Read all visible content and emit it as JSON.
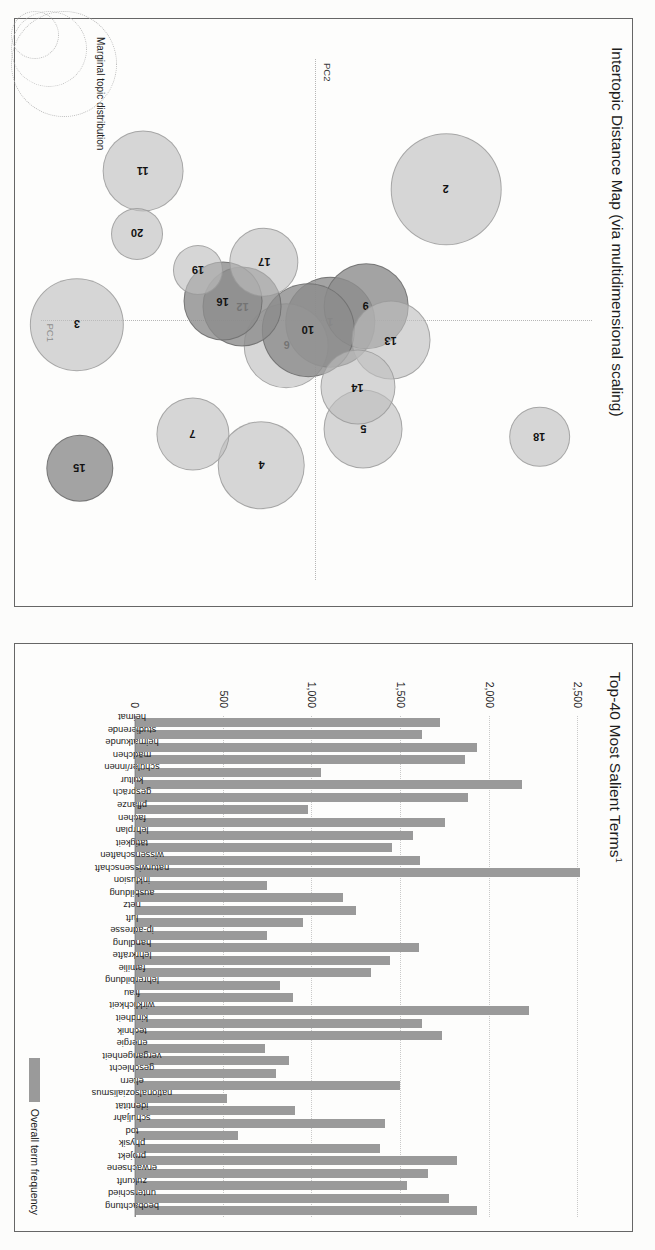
{
  "document": {
    "kind": "pyLDAvis topic model visualization (rotated scan)",
    "page_background": "#fcfcfb",
    "bar_color": "#9a9a9a",
    "bubble_color": "#bebebe"
  },
  "bar_panel": {
    "title": "Top-40 Most Salient Terms",
    "title_superscript": "1",
    "legend_label": "Overall term frequency",
    "legend_swatch_color": "#9a9a9a"
  },
  "scatter_panel": {
    "title": "Intertopic Distance Map (via multidimensional scaling)",
    "axis_x_label": "PC1",
    "axis_y_label": "PC2",
    "marginal_label": "Marginal topic distribution"
  },
  "chart_data": [
    {
      "type": "bar",
      "title": "Top-40 Most Salient Terms¹",
      "xlabel": "",
      "ylabel": "Overall term frequency",
      "ylim": [
        0,
        2600
      ],
      "yticks": [
        0,
        500,
        1000,
        1500,
        2000,
        2500
      ],
      "ytick_labels": [
        "0",
        "500",
        "1,000",
        "1,500",
        "2,000",
        "2,500"
      ],
      "grid": true,
      "legend": [
        "Overall term frequency"
      ],
      "legend_position": "bottom-right",
      "orientation": "vertical-rotated-labels",
      "categories": [
        "heimat",
        "studierende",
        "heimatkunde",
        "mädchen",
        "schüler/innen",
        "kultur",
        "gespräch",
        "pflanze",
        "fachen",
        "lehrplan",
        "tätigkeit",
        "wissenschaften",
        "naturwissenschaft",
        "inklusion",
        "ausbildung",
        "netz",
        "luft",
        "ip-adresse",
        "handlung",
        "lehrkräfte",
        "familie",
        "lehrerbildung",
        "frau",
        "wirklichkeit",
        "kindheit",
        "technik",
        "energie",
        "vergangenheit",
        "geschlecht",
        "eltern",
        "nationalsozialismus",
        "identität",
        "schuljahr",
        "tod",
        "physik",
        "projekt",
        "erwachsene",
        "zukunft",
        "unterschied",
        "beobachtung"
      ],
      "values": [
        1720,
        1620,
        1930,
        1860,
        1050,
        2180,
        1880,
        975,
        1750,
        1570,
        1450,
        1605,
        2510,
        745,
        1175,
        1245,
        950,
        745,
        1600,
        1440,
        1330,
        820,
        890,
        2220,
        1620,
        1730,
        735,
        870,
        795,
        1495,
        520,
        900,
        1410,
        580,
        1380,
        1815,
        1655,
        1535,
        1770,
        1930
      ]
    },
    {
      "type": "scatter",
      "title": "Intertopic Distance Map (via multidimensional scaling)",
      "xlabel": "PC1",
      "ylabel": "PC2",
      "grid": false,
      "note": "bubble size = marginal topic distribution",
      "points": [
        {
          "label": "1",
          "x": 50.5,
          "y": 47.5,
          "r": 8.5,
          "dark": true
        },
        {
          "label": "2",
          "x": 25.0,
          "y": 26.5,
          "r": 10.5,
          "dark": false
        },
        {
          "label": "3",
          "x": 51.0,
          "y": 93.5,
          "r": 8.8,
          "dark": false
        },
        {
          "label": "4",
          "x": 78.0,
          "y": 60.0,
          "r": 8.2,
          "dark": false
        },
        {
          "label": "5",
          "x": 71.0,
          "y": 41.5,
          "r": 7.4,
          "dark": false
        },
        {
          "label": "6",
          "x": 55.0,
          "y": 55.5,
          "r": 8.0,
          "dark": false
        },
        {
          "label": "7",
          "x": 72.0,
          "y": 72.5,
          "r": 6.8,
          "dark": false
        },
        {
          "label": "9",
          "x": 47.5,
          "y": 41.0,
          "r": 8.0,
          "dark": true
        },
        {
          "label": "10",
          "x": 52.0,
          "y": 51.5,
          "r": 8.8,
          "dark": true
        },
        {
          "label": "11",
          "x": 21.5,
          "y": 81.5,
          "r": 7.6,
          "dark": false
        },
        {
          "label": "12",
          "x": 47.5,
          "y": 63.5,
          "r": 7.4,
          "dark": true
        },
        {
          "label": "13",
          "x": 54.0,
          "y": 36.5,
          "r": 7.4,
          "dark": false
        },
        {
          "label": "14",
          "x": 63.0,
          "y": 42.5,
          "r": 7.0,
          "dark": false
        },
        {
          "label": "15",
          "x": 78.5,
          "y": 93.0,
          "r": 6.2,
          "dark": true
        },
        {
          "label": "16",
          "x": 46.5,
          "y": 67.0,
          "r": 7.4,
          "dark": true
        },
        {
          "label": "17",
          "x": 39.0,
          "y": 59.5,
          "r": 6.4,
          "dark": false
        },
        {
          "label": "18",
          "x": 72.5,
          "y": 9.5,
          "r": 5.6,
          "dark": false
        },
        {
          "label": "19",
          "x": 40.5,
          "y": 71.5,
          "r": 4.6,
          "dark": false
        },
        {
          "label": "20",
          "x": 33.5,
          "y": 82.5,
          "r": 4.8,
          "dark": false
        }
      ],
      "xlim": [
        0,
        100
      ],
      "ylim": [
        0,
        100
      ]
    }
  ]
}
